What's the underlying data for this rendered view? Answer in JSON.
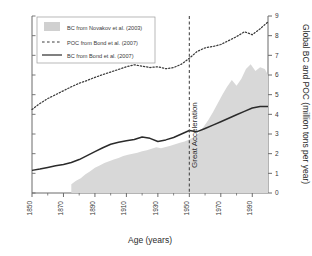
{
  "chart_data": {
    "type": "area",
    "title": "",
    "xlabel": "Age (years)",
    "ylabel": "Global BC and POC (million tons per year)",
    "xlim": [
      1850,
      2000
    ],
    "ylim": [
      0,
      9
    ],
    "xticks": [
      1850,
      1870,
      1890,
      1910,
      1930,
      1950,
      1970,
      1990
    ],
    "xtick_labels": [
      "1850",
      "1870",
      "1890",
      "1910",
      "1930",
      "1950",
      "1970",
      "1990"
    ],
    "yticks": [
      0,
      1,
      2,
      3,
      4,
      5,
      6,
      7,
      8,
      9
    ],
    "ytick_labels": [
      "0",
      "1",
      "2",
      "3",
      "4",
      "5",
      "6",
      "7",
      "8",
      "9"
    ],
    "y_axis_position": "right",
    "grid": false,
    "legend_position": "top-left",
    "annotations": [
      {
        "text": "Great Acceleration",
        "x": 1950,
        "orientation": "vertical",
        "line_style": "dashed"
      }
    ],
    "series": [
      {
        "name": "BC from Novakov et al. (2003)",
        "style": "area",
        "color": "#d8d8d8",
        "x": [
          1875,
          1878,
          1881,
          1884,
          1887,
          1890,
          1893,
          1896,
          1899,
          1902,
          1905,
          1908,
          1911,
          1914,
          1917,
          1920,
          1923,
          1926,
          1929,
          1932,
          1935,
          1938,
          1941,
          1944,
          1947,
          1950,
          1953,
          1956,
          1959,
          1962,
          1965,
          1968,
          1971,
          1974,
          1977,
          1980,
          1983,
          1986,
          1989,
          1992,
          1995,
          1998,
          2000
        ],
        "values": [
          0.45,
          0.62,
          0.75,
          0.95,
          1.1,
          1.28,
          1.4,
          1.52,
          1.62,
          1.7,
          1.78,
          1.88,
          1.95,
          2.0,
          2.05,
          2.12,
          2.18,
          2.25,
          2.32,
          2.28,
          2.34,
          2.4,
          2.48,
          2.55,
          2.62,
          2.72,
          2.85,
          3.05,
          3.35,
          3.7,
          4.1,
          4.55,
          5.0,
          5.4,
          5.75,
          5.45,
          5.8,
          6.3,
          6.55,
          6.2,
          6.4,
          6.3,
          6.0
        ]
      },
      {
        "name": "POC from Bond et al. (2007)",
        "style": "dotted",
        "color": "#3a3a3a",
        "x": [
          1850,
          1855,
          1860,
          1865,
          1870,
          1875,
          1880,
          1885,
          1890,
          1895,
          1900,
          1905,
          1910,
          1915,
          1920,
          1925,
          1930,
          1935,
          1940,
          1945,
          1950,
          1955,
          1960,
          1965,
          1970,
          1975,
          1980,
          1985,
          1990,
          1995,
          2000
        ],
        "values": [
          4.25,
          4.55,
          4.8,
          5.0,
          5.2,
          5.4,
          5.58,
          5.72,
          5.88,
          6.02,
          6.15,
          6.28,
          6.42,
          6.52,
          6.45,
          6.38,
          6.42,
          6.32,
          6.38,
          6.55,
          6.85,
          7.2,
          7.38,
          7.45,
          7.55,
          7.75,
          7.95,
          8.2,
          8.05,
          8.35,
          8.7
        ]
      },
      {
        "name": "BC from Bond et al. (2007)",
        "style": "solid",
        "color": "#2b2b2b",
        "x": [
          1850,
          1855,
          1860,
          1865,
          1870,
          1875,
          1880,
          1885,
          1890,
          1895,
          1900,
          1905,
          1910,
          1915,
          1920,
          1925,
          1930,
          1935,
          1940,
          1945,
          1950,
          1955,
          1960,
          1965,
          1970,
          1975,
          1980,
          1985,
          1990,
          1995,
          2000
        ],
        "values": [
          1.15,
          1.22,
          1.3,
          1.38,
          1.45,
          1.55,
          1.7,
          1.9,
          2.1,
          2.3,
          2.48,
          2.58,
          2.66,
          2.72,
          2.85,
          2.78,
          2.62,
          2.7,
          2.82,
          3.0,
          3.18,
          3.12,
          3.28,
          3.45,
          3.62,
          3.8,
          3.98,
          4.15,
          4.32,
          4.4,
          4.4
        ]
      }
    ]
  },
  "legend": {
    "items": [
      {
        "label": "BC from Novakov et al. (2003)",
        "marker": "swatch"
      },
      {
        "label": "POC from Bond et al. (2007)",
        "marker": "dashed-line"
      },
      {
        "label": "BC from Bond et al. (2007)",
        "marker": "solid-line"
      }
    ]
  },
  "colors": {
    "area_fill": "#d8d8d8",
    "line_dark": "#2b2b2b",
    "axis": "#6b6b6b",
    "text": "#3a3a3a"
  }
}
